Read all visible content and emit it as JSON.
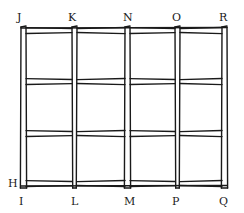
{
  "diagram": {
    "title": "",
    "ink_color": "#1a1a1a",
    "background_color": "#ffffff",
    "top_labels": [
      "J",
      "K",
      "N",
      "O",
      "R"
    ],
    "bottom_labels": [
      "I",
      "L",
      "M",
      "P",
      "Q"
    ],
    "side_labels": [
      "H"
    ],
    "columns": 4,
    "rows": 3,
    "vertical_posts": 5,
    "horizontal_rails": 4
  }
}
